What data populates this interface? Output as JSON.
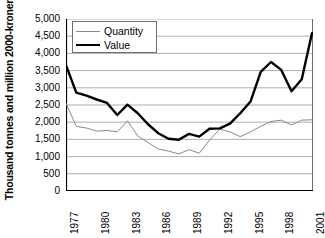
{
  "chart_data": {
    "type": "line",
    "title": "",
    "xlabel": "",
    "ylabel": "Thousand tonnes and million 2000-kroner",
    "ylim": [
      0,
      5000
    ],
    "ytick_labels": [
      "5,000",
      "4,500",
      "4,000",
      "3,500",
      "3,000",
      "2,500",
      "2,000",
      "1,500",
      "1,000",
      "500",
      "0"
    ],
    "ytick_values": [
      5000,
      4500,
      4000,
      3500,
      3000,
      2500,
      2000,
      1500,
      1000,
      500,
      0
    ],
    "grid": true,
    "legend_position": "top-left",
    "x": [
      1977,
      1978,
      1979,
      1980,
      1981,
      1982,
      1983,
      1984,
      1985,
      1986,
      1987,
      1988,
      1989,
      1990,
      1991,
      1992,
      1993,
      1994,
      1995,
      1996,
      1997,
      1998,
      1999,
      2000,
      2001
    ],
    "xtick_labels": [
      "1977",
      "1980",
      "1983",
      "1986",
      "1989",
      "1992",
      "1995",
      "1998",
      "2001"
    ],
    "xtick_values": [
      1977,
      1980,
      1983,
      1986,
      1989,
      1992,
      1995,
      1998,
      2001
    ],
    "series": [
      {
        "name": "Quantity",
        "color": "#8a8a8a",
        "width": 1,
        "values": [
          2550,
          1880,
          1830,
          1740,
          1760,
          1720,
          2040,
          1600,
          1410,
          1220,
          1160,
          1080,
          1200,
          1100,
          1480,
          1800,
          1720,
          1580,
          1720,
          1880,
          2020,
          2060,
          1920,
          2060,
          2070
        ]
      },
      {
        "name": "Value",
        "color": "#000000",
        "width": 2.4,
        "values": [
          3660,
          2860,
          2770,
          2660,
          2560,
          2210,
          2510,
          2260,
          1940,
          1680,
          1520,
          1490,
          1660,
          1580,
          1810,
          1820,
          1960,
          2260,
          2600,
          3460,
          3750,
          3520,
          2900,
          3250,
          4590
        ]
      }
    ]
  },
  "legend": {
    "items": [
      {
        "label": "Quantity",
        "style": "thin"
      },
      {
        "label": "Value",
        "style": "thick"
      }
    ]
  }
}
